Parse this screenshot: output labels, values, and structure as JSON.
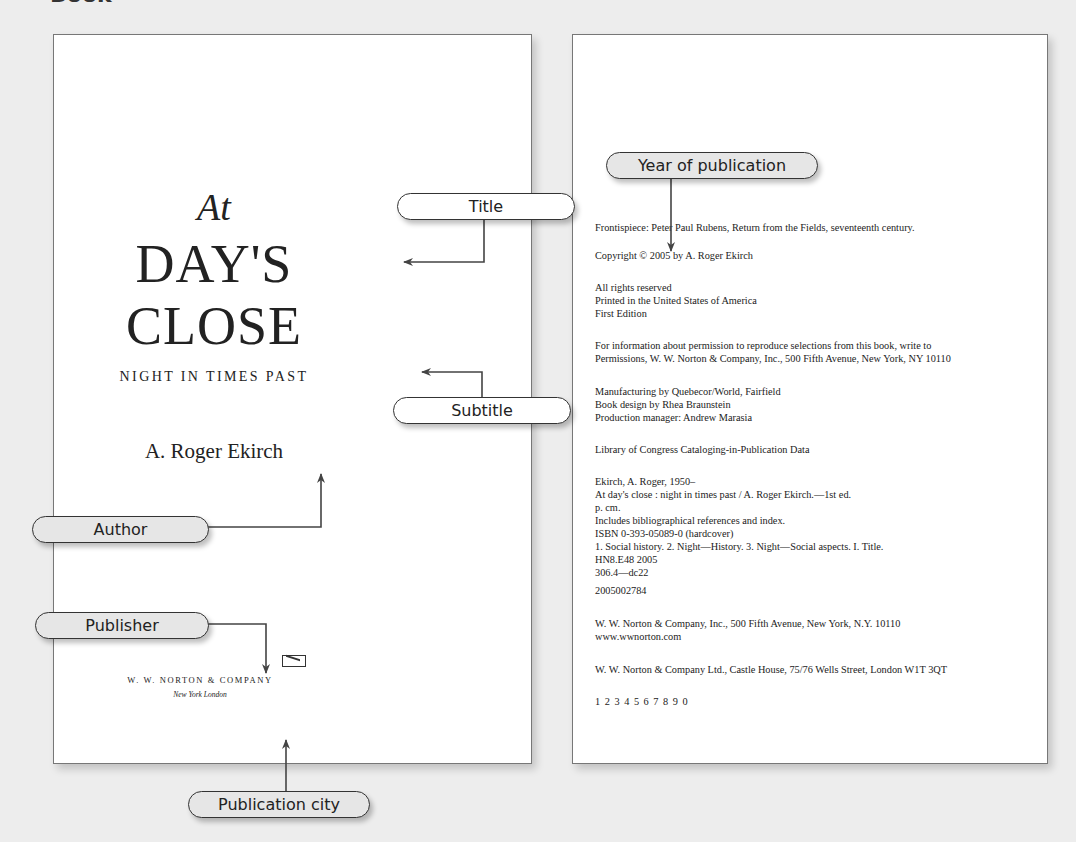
{
  "heading": "Book",
  "left_page": {
    "title_prefix": "At",
    "title_line1": "DAY'S",
    "title_line2": "CLOSE",
    "subtitle": "NIGHT IN TIMES PAST",
    "author": "A. Roger Ekirch",
    "publisher_logo": "norton-colophon-icon",
    "publisher": "W. W. NORTON & COMPANY",
    "cities": "New York   London"
  },
  "right_page": {
    "lines": {
      "frontispiece": "Frontispiece: Peter Paul Rubens, Return from the Fields, seventeenth century.",
      "copyright": "Copyright © 2005 by A. Roger Ekirch",
      "rights": "All rights reserved",
      "printed": "Printed in the United States of America",
      "edition": "First Edition",
      "permission1": "For information about permission to reproduce selections from this book, write to",
      "permission2": "Permissions, W. W. Norton & Company, Inc., 500 Fifth Avenue, New York, NY 10110",
      "manufacturing": "Manufacturing by Quebecor/World, Fairfield",
      "design": "Book design by Rhea Braunstein",
      "production": "Production manager: Andrew Marasia",
      "loc": "Library of Congress Cataloging-in-Publication Data",
      "cip_author": "Ekirch, A. Roger, 1950–",
      "cip_title": "At day's close : night in times past / A. Roger Ekirch.—1st ed.",
      "cip_pages": "p. cm.",
      "cip_includes": "Includes bibliographical references and index.",
      "cip_isbn": "ISBN 0-393-05089-0 (hardcover)",
      "cip_subjects": "1. Social history. 2. Night—History. 3. Night—Social aspects. I. Title.",
      "cip_class": "HN8.E48 2005",
      "cip_dewey": "306.4—dc22",
      "cip_lccn": "2005002784",
      "address_us": "W. W. Norton & Company, Inc., 500 Fifth Avenue, New York, N.Y. 10110",
      "website": "www.wwnorton.com",
      "address_uk": "W. W. Norton & Company Ltd., Castle House, 75/76 Wells Street, London W1T 3QT",
      "printing": "1 2 3 4 5 6 7 8 9 0"
    }
  },
  "callouts": {
    "title": "Title",
    "subtitle": "Subtitle",
    "author": "Author",
    "publisher": "Publisher",
    "city": "Publication city",
    "year": "Year of publication"
  },
  "colors": {
    "background": "#ededed",
    "page": "#ffffff",
    "pill_white": "#ffffff",
    "pill_grey": "#e6e6e6",
    "line": "#444444"
  }
}
